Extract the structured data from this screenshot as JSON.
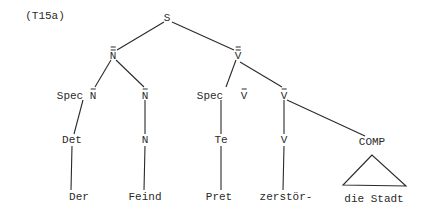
{
  "example_label": "(T15a)",
  "nodes": {
    "S": "S",
    "NPP": "N",
    "VPP": "V",
    "spec_n": "Spec",
    "spec_n_bar": "N",
    "n_bar": "N",
    "spec_v": "Spec",
    "spec_v_bar": "V",
    "v_bar": "V",
    "det": "Det",
    "n": "N",
    "te": "Te",
    "v": "V",
    "comp": "COMP"
  },
  "leaves": {
    "der": "Der",
    "feind": "Feind",
    "pret": "Pret",
    "zerstor": "zerstör-",
    "die_stadt": "die Stadt"
  },
  "notation": {
    "NPP": "double-bar",
    "VPP": "double-bar",
    "spec_n_bar": "single-bar",
    "n_bar": "single-bar",
    "spec_v_bar": "single-bar",
    "v_bar": "single-bar"
  }
}
